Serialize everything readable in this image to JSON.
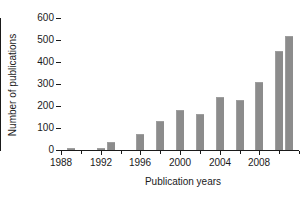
{
  "chart_data": {
    "type": "bar",
    "title": "",
    "xlabel": "Publication years",
    "ylabel": "Number of publications",
    "categories": [
      1989,
      1990,
      1991,
      1992,
      1993,
      1994,
      1995,
      1996,
      1997,
      1998,
      1999,
      2000,
      2001,
      2002,
      2003,
      2004,
      2005,
      2006,
      2007,
      2008,
      2009,
      2010,
      2011
    ],
    "values": [
      7,
      0,
      0,
      8,
      35,
      0,
      0,
      72,
      0,
      133,
      0,
      180,
      0,
      162,
      0,
      240,
      0,
      225,
      0,
      310,
      0,
      450,
      520
    ],
    "bars": [
      {
        "year": 1989,
        "value": 7
      },
      {
        "year": 1992,
        "value": 8
      },
      {
        "year": 1993,
        "value": 35
      },
      {
        "year": 1996,
        "value": 72
      },
      {
        "year": 1998,
        "value": 133
      },
      {
        "year": 2000,
        "value": 180
      },
      {
        "year": 2002,
        "value": 162
      },
      {
        "year": 2004,
        "value": 240
      },
      {
        "year": 2006,
        "value": 225
      },
      {
        "year": 2008,
        "value": 310
      },
      {
        "year": 2010,
        "value": 450
      },
      {
        "year": 2011,
        "value": 520
      }
    ],
    "ylim": [
      0,
      600
    ],
    "yticks": [
      0,
      100,
      200,
      300,
      400,
      500,
      600
    ],
    "ytick_labels": [
      "0",
      "100",
      "200",
      "300",
      "400",
      "500",
      "600"
    ],
    "xlim": [
      1988,
      2012
    ],
    "xticks": [
      1988,
      1992,
      1996,
      2000,
      2004,
      2008
    ],
    "xtick_labels": [
      "1988",
      "1992",
      "1996",
      "2000",
      "2004",
      "2008"
    ],
    "grid": false,
    "legend": null,
    "bar_color": "#8c8c8c",
    "axis_color": "#1a1a1a",
    "background": "#ffffff"
  }
}
